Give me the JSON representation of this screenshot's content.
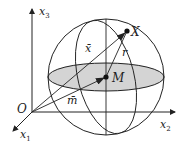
{
  "diagram": {
    "labels": {
      "x3_axis": "x",
      "x3_sub": "3",
      "x2_axis": "x",
      "x2_sub": "2",
      "x1_axis": "x",
      "x1_sub": "1",
      "origin": "O",
      "point_X": "X",
      "center_M": "M",
      "vector_x": "x̄",
      "vector_m": "m̄",
      "radius": "r"
    },
    "colors": {
      "line": "#222222",
      "disk_fill": "#d4d4d4",
      "background": "#ffffff"
    }
  }
}
